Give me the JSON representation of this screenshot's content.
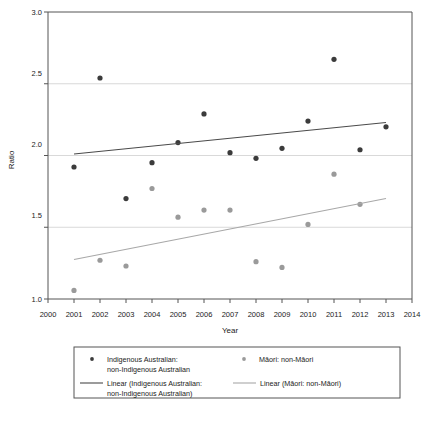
{
  "chart_data": {
    "type": "scatter",
    "title": "",
    "xlabel": "Year",
    "ylabel": "Ratio",
    "xlim": [
      2000,
      2014
    ],
    "ylim": [
      1.0,
      3.0
    ],
    "xticks": [
      2000,
      2001,
      2002,
      2003,
      2004,
      2005,
      2006,
      2007,
      2008,
      2009,
      2010,
      2011,
      2012,
      2013,
      2014
    ],
    "xtick_labels": [
      "2000",
      "2001",
      "2002",
      "2003",
      "2004",
      "2005",
      "2006",
      "2007",
      "2008",
      "2009",
      "2010",
      "2011",
      "2012",
      "2013",
      "2014"
    ],
    "yticks": [
      1.0,
      1.5,
      2.0,
      2.5,
      3.0
    ],
    "ytick_labels": [
      "1.0",
      "1.5",
      "2.0",
      "2.5",
      "3.0"
    ],
    "grid": "horizontal",
    "legend_position": "below-axes",
    "series": [
      {
        "name": "Indigenous Australian: non-Indigenous Australian",
        "kind": "scatter",
        "color": "#3b3b3b",
        "x": [
          2001,
          2002,
          2003,
          2004,
          2005,
          2006,
          2007,
          2008,
          2009,
          2010,
          2011,
          2012,
          2013
        ],
        "values": [
          1.92,
          2.54,
          1.7,
          1.95,
          2.09,
          2.29,
          2.02,
          1.98,
          2.05,
          2.24,
          2.67,
          2.04,
          2.2
        ]
      },
      {
        "name": "Māori: non-Māori",
        "kind": "scatter",
        "color": "#9a9a9a",
        "x": [
          2001,
          2002,
          2003,
          2004,
          2005,
          2006,
          2007,
          2008,
          2009,
          2010,
          2011,
          2012
        ],
        "values": [
          1.06,
          1.27,
          1.23,
          1.77,
          1.57,
          1.62,
          1.62,
          1.26,
          1.22,
          1.52,
          1.87,
          1.66
        ]
      },
      {
        "name": "Linear (Indigenous Australian: non-Indigenous Australian)",
        "kind": "trendline",
        "color": "#4a4a4a",
        "x": [
          2001,
          2013
        ],
        "values": [
          2.01,
          2.23
        ]
      },
      {
        "name": "Linear (Māori: non-Māori)",
        "kind": "trendline",
        "color": "#a8a8a8",
        "x": [
          2001,
          2013
        ],
        "values": [
          1.275,
          1.7
        ]
      }
    ]
  },
  "axes": {
    "ylabel": "Ratio",
    "xlabel": "Year",
    "ytick_0": "1.0",
    "ytick_1": "1.5",
    "ytick_2": "2.0",
    "ytick_3": "2.5",
    "ytick_4": "3.0",
    "xtick_0": "2000",
    "xtick_1": "2001",
    "xtick_2": "2002",
    "xtick_3": "2003",
    "xtick_4": "2004",
    "xtick_5": "2005",
    "xtick_6": "2006",
    "xtick_7": "2007",
    "xtick_8": "2008",
    "xtick_9": "2009",
    "xtick_10": "2010",
    "xtick_11": "2011",
    "xtick_12": "2012",
    "xtick_13": "2013",
    "xtick_14": "2014"
  },
  "legend": {
    "entry_1_line_1": "Indigenous Australian:",
    "entry_1_line_2": "non-Indigenous Australian",
    "entry_2_line_1": "Māori: non-Māori",
    "entry_3_line_1": "Linear (Indigenous Australian:",
    "entry_3_line_2": "non-Indigenous Australian)",
    "entry_4_line_1": "Linear (Māori: non-Māori)"
  },
  "colors": {
    "series_1": "#3b3b3b",
    "series_2": "#9a9a9a",
    "trend_1": "#4a4a4a",
    "trend_2": "#a8a8a8",
    "axis": "#555555",
    "grid": "#cfcfcf",
    "background": "#ffffff"
  }
}
